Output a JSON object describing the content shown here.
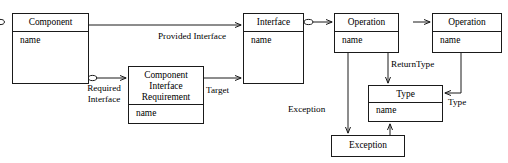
{
  "diagram": {
    "kind": "uml-class-diagram",
    "title_fragment_cropped": "",
    "canvas": {
      "width": 508,
      "height": 163,
      "background": "#ffffff"
    },
    "stroke_color": "#1a1a1a",
    "text_color": "#000000",
    "classes": [
      {
        "id": "component",
        "name": "Component",
        "attributes": "name",
        "x": 12,
        "y": 13,
        "width": 77,
        "height": 71,
        "header_height": 18
      },
      {
        "id": "component-interface-requirement",
        "name": "Component\nInterface\nRequirement",
        "attributes": "name",
        "x": 128,
        "y": 66,
        "width": 76,
        "height": 58,
        "header_height": 38
      },
      {
        "id": "interface",
        "name": "Interface",
        "attributes": "name",
        "x": 243,
        "y": 13,
        "width": 61,
        "height": 71,
        "header_height": 18
      },
      {
        "id": "operation-owner",
        "name": "Operation",
        "attributes": "name",
        "x": 334,
        "y": 13,
        "width": 65,
        "height": 40,
        "header_height": 18
      },
      {
        "id": "operation-target",
        "name": "Operation",
        "attributes": "name",
        "x": 432,
        "y": 13,
        "width": 70,
        "height": 40,
        "header_height": 18
      },
      {
        "id": "type",
        "name": "Type",
        "attributes": "name",
        "x": 368,
        "y": 85,
        "width": 75,
        "height": 37,
        "header_height": 18
      },
      {
        "id": "exception",
        "name": "Exception",
        "attributes": "",
        "x": 331,
        "y": 135,
        "width": 74,
        "height": 22,
        "header_height": 22
      }
    ],
    "edge_labels": [
      {
        "id": "provided-interface",
        "text": "Provided Interface",
        "x": 158,
        "y": 31
      },
      {
        "id": "required-interface",
        "text": "Required\nInterface",
        "x": 85,
        "y": 85
      },
      {
        "id": "target",
        "text": "Target",
        "x": 206,
        "y": 86
      },
      {
        "id": "return-type",
        "text": "ReturnType",
        "x": 391,
        "y": 60
      },
      {
        "id": "type-association",
        "text": "Type",
        "x": 447,
        "y": 98
      },
      {
        "id": "exception-association",
        "text": "Exception",
        "x": 288,
        "y": 105
      }
    ],
    "connectors": [
      {
        "id": "component-to-interface",
        "label_ref": "provided-interface",
        "from": "component",
        "to": "interface",
        "arrow": "open",
        "source_decoration": "none"
      },
      {
        "id": "component-to-requirement",
        "label_ref": "required-interface",
        "from": "component",
        "to": "component-interface-requirement",
        "arrow": "open",
        "source_decoration": "aggregation-diamond"
      },
      {
        "id": "requirement-to-interface",
        "label_ref": "target",
        "from": "component-interface-requirement",
        "to": "interface",
        "arrow": "open",
        "source_decoration": "none"
      },
      {
        "id": "interface-to-operation",
        "label_ref": "",
        "from": "interface",
        "to": "operation-owner",
        "arrow": "open",
        "source_decoration": "aggregation-diamond"
      },
      {
        "id": "operation-to-operation",
        "label_ref": "",
        "from": "operation-owner",
        "to": "operation-target",
        "arrow": "open",
        "source_decoration": "aggregation-diamond"
      },
      {
        "id": "operation-to-type",
        "label_ref": "return-type",
        "from": "operation-owner",
        "to": "type",
        "arrow": "open",
        "source_decoration": "none"
      },
      {
        "id": "operation-target-to-type",
        "label_ref": "type-association",
        "from": "operation-target",
        "to": "type",
        "arrow": "open",
        "source_decoration": "none"
      },
      {
        "id": "operation-to-exception",
        "label_ref": "exception-association",
        "from": "operation-owner",
        "to": "exception",
        "arrow": "open",
        "source_decoration": "none"
      },
      {
        "id": "exception-to-type",
        "label_ref": "",
        "from": "exception",
        "to": "type",
        "arrow": "open",
        "source_decoration": "none"
      }
    ]
  }
}
